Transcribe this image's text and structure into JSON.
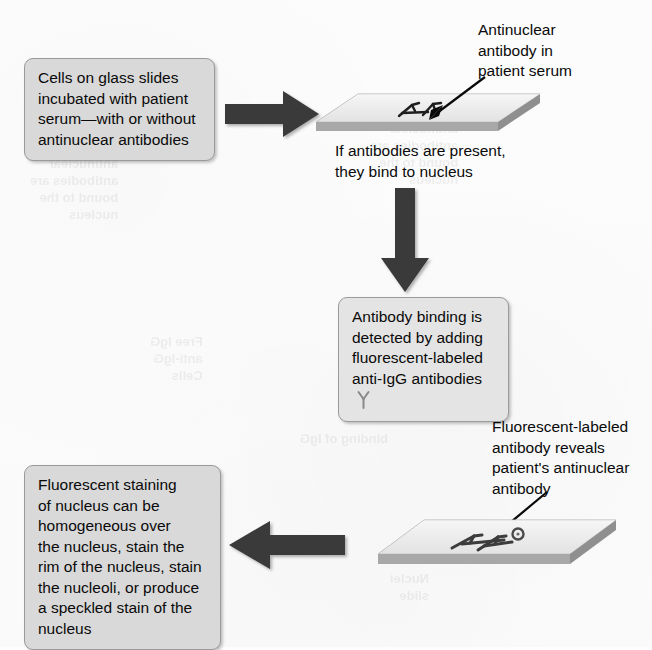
{
  "figure": {
    "type": "process-flow-diagram"
  },
  "boxes": {
    "step1": "Cells on glass slides\nincubated with patient\nserum—with or without\nantinuclear antibodies",
    "step2": "Antibody binding is\ndetected by adding\nfluorescent-labeled\nanti-IgG antibodies",
    "step3": "Fluorescent staining\nof nucleus can be\nhomogeneous over\nthe nucleus, stain the\nrim of the nucleus, stain\nthe nucleoli, or produce\na speckled stain of the\nnucleus"
  },
  "labels": {
    "antinuclear_antibody": "Antinuclear\nantibody in\npatient serum",
    "binding_caption": "If antibodies are present,\nthey bind to nucleus",
    "fluorescent_reveal": "Fluorescent-labeled\nantibody reveals\npatient's antinuclear\nantibody"
  },
  "bleed_through": {
    "b1": "antinuclear\nantibodies are\nbound to the\nnucleus",
    "b2": "detected\nfluorescent\nstaining",
    "b3": "Free IgG\nanti-IgG\nCells",
    "b4": "binding of IgG",
    "b5": "Nuclei\nslide"
  },
  "colors": {
    "page_background": "#fdfdfd",
    "box_fill": "#d9d9d9",
    "box_border": "#9a9a9a",
    "arrow_fill": "#3a3a3a",
    "slide_top": "#ededed",
    "slide_edge": "#a8a8a8",
    "ink": "#0a0a0a",
    "antibody_glyph": "#8a8a8a"
  },
  "icons": {
    "block_arrow_right": "block-arrow-right-icon",
    "block_arrow_down": "block-arrow-down-icon",
    "block_arrow_left": "block-arrow-left-icon",
    "pointer_arrow": "pointer-arrow-icon",
    "antibody_y": "antibody-y-icon",
    "microscope_slide": "microscope-slide-icon"
  }
}
